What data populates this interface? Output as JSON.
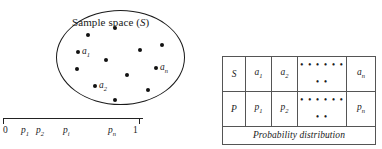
{
  "figure": {
    "sample_space": {
      "label_text": "Sample space (",
      "label_symbol": "S",
      "label_close": ")",
      "points": [
        {
          "name": "dot-1",
          "x": 30,
          "y": 23
        },
        {
          "name": "dot-2",
          "x": 57,
          "y": 16
        },
        {
          "name": "dot-3",
          "x": 20,
          "y": 40,
          "label": "a",
          "sub": "1"
        },
        {
          "name": "dot-4",
          "x": 48,
          "y": 48
        },
        {
          "name": "dot-5",
          "x": 82,
          "y": 38
        },
        {
          "name": "dot-6",
          "x": 104,
          "y": 33
        },
        {
          "name": "dot-7",
          "x": 19,
          "y": 57
        },
        {
          "name": "dot-8",
          "x": 98,
          "y": 56,
          "label": "a",
          "sub": "n"
        },
        {
          "name": "dot-9",
          "x": 69,
          "y": 63
        },
        {
          "name": "dot-10",
          "x": 37,
          "y": 74,
          "label": "a",
          "sub": "2"
        },
        {
          "name": "dot-11",
          "x": 90,
          "y": 78
        },
        {
          "name": "dot-12",
          "x": 57,
          "y": 88
        }
      ]
    },
    "number_line": {
      "start_label": "0",
      "end_label": "1",
      "ticks": [
        {
          "name": "tick-zero",
          "x": 0
        },
        {
          "name": "tick-one",
          "x": 136
        }
      ],
      "labels": [
        {
          "name": "nl-zero",
          "x": 0,
          "text": "0",
          "sub": "",
          "italic": false
        },
        {
          "name": "nl-p1",
          "x": 18,
          "text": "p",
          "sub": "1",
          "italic": true
        },
        {
          "name": "nl-p2",
          "x": 33,
          "text": "p",
          "sub": "2",
          "italic": true
        },
        {
          "name": "nl-pi",
          "x": 60,
          "text": "p",
          "sub": "i",
          "italic": true
        },
        {
          "name": "nl-pn",
          "x": 105,
          "text": "p",
          "sub": "n",
          "italic": true
        },
        {
          "name": "nl-one",
          "x": 130,
          "text": "1",
          "sub": "",
          "italic": false
        }
      ]
    },
    "table": {
      "caption": "Probability distribution",
      "dots_glyph": "• • • • • • • •",
      "rows": [
        {
          "name": "row-outcomes",
          "cells": [
            {
              "name": "cell-S",
              "base": "S",
              "sub": ""
            },
            {
              "name": "cell-a1",
              "base": "a",
              "sub": "1"
            },
            {
              "name": "cell-a2",
              "base": "a",
              "sub": "2"
            },
            {
              "name": "cell-dots-outcomes",
              "base": "",
              "sub": ""
            },
            {
              "name": "cell-an",
              "base": "a",
              "sub": "n"
            }
          ]
        },
        {
          "name": "row-probabilities",
          "cells": [
            {
              "name": "cell-P",
              "base": "P",
              "sub": ""
            },
            {
              "name": "cell-p1",
              "base": "p",
              "sub": "1"
            },
            {
              "name": "cell-p2",
              "base": "p",
              "sub": "2"
            },
            {
              "name": "cell-dots-probabilities",
              "base": "",
              "sub": ""
            },
            {
              "name": "cell-pn",
              "base": "p",
              "sub": "n"
            }
          ]
        }
      ]
    }
  },
  "colors": {
    "ink": "#1a1a1a",
    "dot": "#111111",
    "rule": "#555555",
    "background": "#ffffff"
  }
}
